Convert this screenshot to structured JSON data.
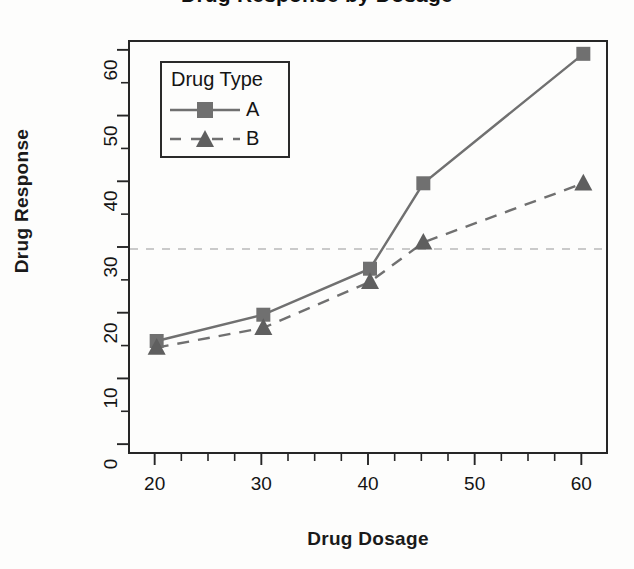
{
  "chart_data": {
    "type": "line",
    "title": "Drug Response by Dosage",
    "xlabel": "Drug Dosage",
    "ylabel": "Drug Response",
    "x": [
      20,
      30,
      40,
      45,
      60
    ],
    "series": [
      {
        "name": "A",
        "values": [
          16,
          20,
          27,
          40,
          59.7
        ],
        "marker": "square",
        "linestyle": "solid",
        "color": "#707070"
      },
      {
        "name": "B",
        "values": [
          15,
          18,
          25,
          31,
          40
        ],
        "marker": "triangle",
        "linestyle": "dashed",
        "color": "#707070"
      }
    ],
    "legend": {
      "title": "Drug Type",
      "position": "top-left",
      "entries": [
        "A",
        "B"
      ]
    },
    "xlim": [
      17.5,
      62.5
    ],
    "ylim": [
      -1.5,
      61.5
    ],
    "xticks": [
      20,
      30,
      40,
      50,
      60
    ],
    "xtick_labels": [
      "20",
      "30",
      "40",
      "50",
      "60"
    ],
    "xminor_step": 2.5,
    "yticks": [
      0,
      10,
      20,
      30,
      40,
      50,
      60
    ],
    "ytick_labels": [
      "0",
      "10",
      "20",
      "30",
      "40",
      "50",
      "60"
    ],
    "yminor_step": 5,
    "grid": false,
    "annotations": [
      {
        "type": "hline",
        "value": 30,
        "linestyle": "dashed",
        "color": "#b9b9b9",
        "label": ""
      }
    ],
    "axis_color": "#262626",
    "text_color": "#141414",
    "background": "#fdfdfc"
  }
}
